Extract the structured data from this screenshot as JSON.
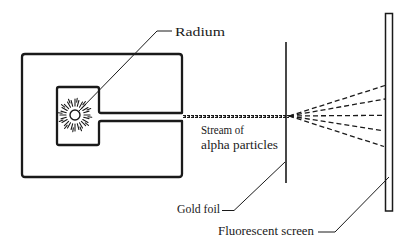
{
  "diagram": {
    "labels": {
      "radium": "Radium",
      "stream_line1": "Stream of",
      "stream_line2": "alpha particles",
      "gold_foil": "Gold foil",
      "fluorescent_screen": "Fluorescent screen"
    },
    "components": [
      "lead-block-with-radium-source",
      "alpha-particle-stream",
      "gold-foil",
      "deflected-particle-paths",
      "fluorescent-screen"
    ],
    "deflected_paths_count": 5,
    "colors": {
      "ink": "#1a1a1a",
      "background": "#ffffff"
    }
  }
}
